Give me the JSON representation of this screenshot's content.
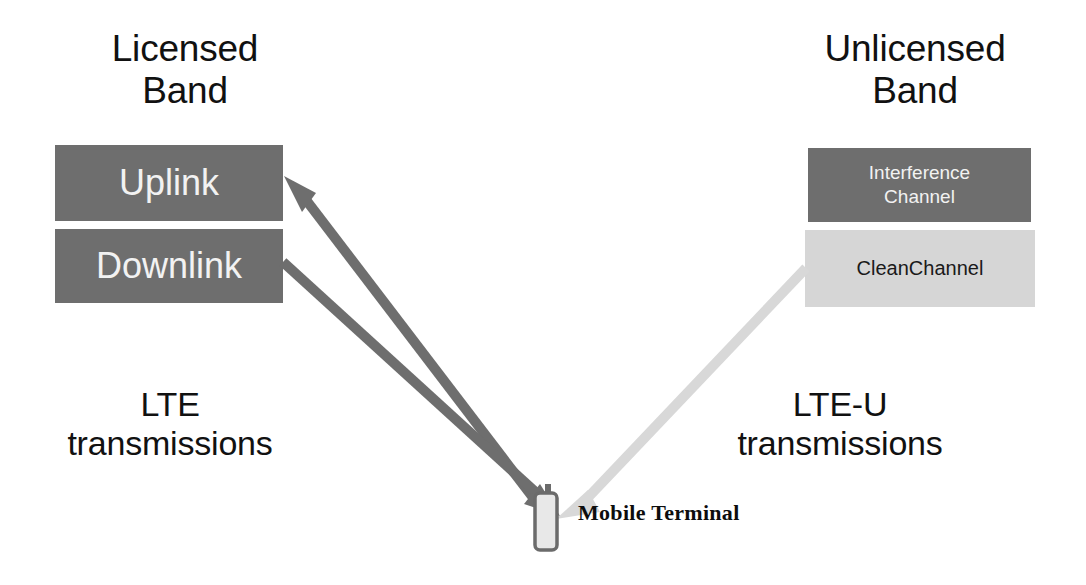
{
  "diagram": {
    "colors": {
      "dark_box": "#6e6e6e",
      "light_box": "#d6d6d6",
      "dark_arrow": "#6e6e6e",
      "light_arrow": "#d8d8d8",
      "text_dark": "#111111",
      "text_light": "#f2f2f2",
      "background": "#ffffff"
    }
  },
  "licensed": {
    "band_title": "Licensed\nBand",
    "boxes": [
      {
        "label": "Uplink",
        "style": "dark"
      },
      {
        "label": "Downlink",
        "style": "dark"
      }
    ],
    "transmissions_label": "LTE\ntransmissions"
  },
  "unlicensed": {
    "band_title": "Unlicensed\nBand",
    "boxes": [
      {
        "label": "Interference\nChannel",
        "style": "dark"
      },
      {
        "label": "CleanChannel",
        "style": "light"
      }
    ],
    "transmissions_label": "LTE-U\ntransmissions"
  },
  "terminal": {
    "label": "Mobile Terminal",
    "icon": "mobile-phone-icon"
  },
  "arrows": [
    {
      "name": "uplink-arrow",
      "direction": "terminal-to-uplink",
      "color": "#6e6e6e",
      "from": "Mobile Terminal",
      "to": "Uplink"
    },
    {
      "name": "downlink-arrow",
      "direction": "downlink-to-terminal",
      "color": "#6e6e6e",
      "from": "Downlink",
      "to": "Mobile Terminal"
    },
    {
      "name": "clean-channel-arrow",
      "direction": "clean-channel-to-terminal",
      "color": "#d8d8d8",
      "from": "CleanChannel",
      "to": "Mobile Terminal"
    }
  ]
}
